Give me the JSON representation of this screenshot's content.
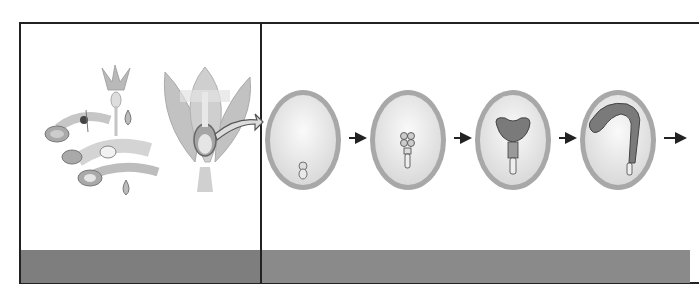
{
  "figure": {
    "title": "",
    "panels": [
      {
        "id": "left",
        "description": "Flowering plant life cycle with cutaway flower showing ovule",
        "elements": [
          "life-cycle-wheel",
          "small-flower",
          "cutaway-flower",
          "ovule-callout-arrow"
        ],
        "caption": ""
      },
      {
        "id": "right",
        "description": "Embryo development stages within the seed",
        "stages": [
          {
            "label": "",
            "name": "zygote"
          },
          {
            "label": "",
            "name": "proembryo"
          },
          {
            "label": "",
            "name": "heart-stage"
          },
          {
            "label": "",
            "name": "torpedo-stage"
          }
        ],
        "caption": ""
      }
    ],
    "colors": {
      "border": "#222222",
      "band_left": "#7e7e7e",
      "band_right": "#8a8a8a",
      "ovule_rim": "#9a9a9a",
      "ovule_fill": "#ececec",
      "embryo": "#6a6a6a"
    }
  }
}
